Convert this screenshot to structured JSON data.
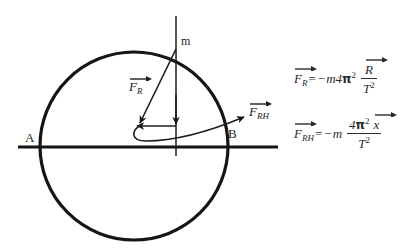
{
  "figure": {
    "title_text": "",
    "stroke_color": "#151515",
    "text_color": "#1f1f1f",
    "background": "#ffffff",
    "circle": {
      "cx": 134,
      "cy": 146,
      "r": 94
    },
    "labels": {
      "mass": "m",
      "point_a": "A",
      "point_b": "B",
      "force_radial": {
        "symbol": "F",
        "subscript": "R",
        "vector": true
      },
      "force_horizontal": {
        "symbol": "F",
        "subscript": "RH",
        "vector": true
      }
    }
  },
  "equations": {
    "eq1": {
      "lhs_symbol": "F",
      "lhs_subscript": "R",
      "equals": "=",
      "sign": "−",
      "mass": "m",
      "coefficient": "4",
      "pi": "π",
      "pi_exponent": "2",
      "numerator_symbol": "R",
      "denominator_symbol": "T",
      "denominator_exponent": "2"
    },
    "eq2": {
      "lhs_symbol": "F",
      "lhs_subscript": "RH",
      "equals": "=",
      "sign": "−",
      "mass": "m",
      "coefficient": "4",
      "pi": "π",
      "pi_exponent": "2",
      "numerator_symbol": "x",
      "denominator_symbol": "T",
      "denominator_exponent": "2"
    }
  }
}
